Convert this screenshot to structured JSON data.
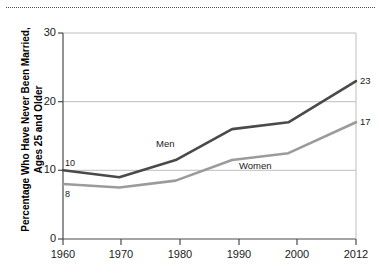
{
  "figure": {
    "has_top_dotted_rule": true,
    "background": "#ffffff"
  },
  "chart_data": {
    "type": "line",
    "title": "",
    "subtitle": "",
    "xlabel": "",
    "ylabel": "Percentage Who Have Never Been Married,\nAges 25 and Older",
    "x": [
      1960,
      1970,
      1980,
      1990,
      2000,
      2012
    ],
    "xtick_labels": [
      "1960",
      "1970",
      "1980",
      "1990",
      "2000",
      "2012"
    ],
    "ytick_labels": [
      "0",
      "10",
      "20",
      "30"
    ],
    "yticks": [
      0,
      10,
      20,
      30
    ],
    "xlim": [
      1960,
      2012
    ],
    "ylim": [
      0,
      30
    ],
    "grid": "horizontal",
    "legend_position": "inline-annotations",
    "series": [
      {
        "name": "Men",
        "color": "#4a4a4a",
        "values": [
          10,
          9,
          11.5,
          16,
          17,
          23
        ],
        "start_label": "10",
        "end_label": "23"
      },
      {
        "name": "Women",
        "color": "#9b9b9b",
        "values": [
          8,
          7.5,
          8.5,
          11.5,
          12.5,
          17
        ],
        "start_label": "8",
        "end_label": "17"
      }
    ],
    "annotations": [
      {
        "text": "Men",
        "series": "Men"
      },
      {
        "text": "Women",
        "series": "Women"
      }
    ]
  }
}
